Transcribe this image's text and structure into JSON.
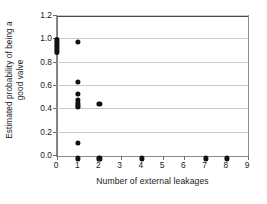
{
  "chart_data": {
    "type": "scatter",
    "title": "",
    "xlabel": "Number of external leakages",
    "ylabel_line1": "Estimated probability of being a",
    "ylabel_line2": "good valve",
    "ylabel": "Estimated probability of being a good valve",
    "xlim": [
      0,
      9
    ],
    "ylim": [
      0.0,
      1.2
    ],
    "xticks": [
      0,
      1,
      2,
      3,
      4,
      5,
      6,
      7,
      8,
      9
    ],
    "xtick_labels": [
      "0",
      "1",
      "2",
      "3",
      "4",
      "5",
      "6",
      "7",
      "8",
      "9"
    ],
    "yticks": [
      0.0,
      0.2,
      0.4,
      0.6,
      0.8,
      1.0,
      1.2
    ],
    "ytick_labels": [
      "0.0",
      "0.2",
      "0.4",
      "0.6",
      "0.8",
      "1.0",
      "1.2"
    ],
    "grid": "horizontal",
    "legend": "none",
    "marker": "filled-circle",
    "marker_color": "#111111",
    "gridline_color": "#c9c9c9",
    "frame_color": "#8c8c8c",
    "points": [
      {
        "x": 0,
        "y": 1.0
      },
      {
        "x": 0,
        "y": 0.99
      },
      {
        "x": 0,
        "y": 0.975
      },
      {
        "x": 0,
        "y": 0.96
      },
      {
        "x": 0,
        "y": 0.945
      },
      {
        "x": 0,
        "y": 0.93
      },
      {
        "x": 0,
        "y": 0.915
      },
      {
        "x": 0,
        "y": 0.9
      },
      {
        "x": 0,
        "y": 0.89
      },
      {
        "x": 1,
        "y": 1.0
      },
      {
        "x": 1,
        "y": 0.655
      },
      {
        "x": 1,
        "y": 0.55
      },
      {
        "x": 1,
        "y": 0.5
      },
      {
        "x": 1,
        "y": 0.475
      },
      {
        "x": 1,
        "y": 0.455
      },
      {
        "x": 1,
        "y": 0.44
      },
      {
        "x": 1,
        "y": 0.13
      },
      {
        "x": 1,
        "y": 0.0
      },
      {
        "x": 2,
        "y": 0.47
      },
      {
        "x": 2,
        "y": 0.0
      },
      {
        "x": 4,
        "y": 0.0
      },
      {
        "x": 7,
        "y": 0.0
      },
      {
        "x": 8,
        "y": 0.0
      }
    ],
    "dense_stacks": [
      {
        "x": 0,
        "y_low": 0.885,
        "y_high": 1.0,
        "note": "overlapping markers drawn as solid bar"
      }
    ]
  }
}
